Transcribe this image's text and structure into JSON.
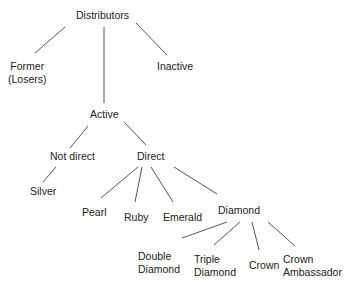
{
  "diagram": {
    "type": "tree",
    "line_color": "#555555",
    "nodes": {
      "distributors": {
        "label": "Distributors"
      },
      "former": {
        "line1": "Former",
        "line2": "(Losers)"
      },
      "inactive": {
        "label": "Inactive"
      },
      "active": {
        "label": "Active"
      },
      "not_direct": {
        "label": "Not direct"
      },
      "direct": {
        "label": "Direct"
      },
      "silver": {
        "label": "Silver"
      },
      "pearl": {
        "label": "Pearl"
      },
      "ruby": {
        "label": "Ruby"
      },
      "emerald": {
        "label": "Emerald"
      },
      "diamond": {
        "label": "Diamond"
      },
      "double_diamond": {
        "line1": "Double",
        "line2": "Diamond"
      },
      "triple_diamond": {
        "line1": "Triple",
        "line2": "Diamond"
      },
      "crown": {
        "label": "Crown"
      },
      "crown_ambassador": {
        "line1": "Crown",
        "line2": "Ambassador"
      }
    },
    "edges": [
      [
        "distributors",
        "former"
      ],
      [
        "distributors",
        "active"
      ],
      [
        "distributors",
        "inactive"
      ],
      [
        "active",
        "not_direct"
      ],
      [
        "active",
        "direct"
      ],
      [
        "not_direct",
        "silver"
      ],
      [
        "direct",
        "pearl"
      ],
      [
        "direct",
        "ruby"
      ],
      [
        "direct",
        "emerald"
      ],
      [
        "direct",
        "diamond"
      ],
      [
        "diamond",
        "double_diamond"
      ],
      [
        "diamond",
        "triple_diamond"
      ],
      [
        "diamond",
        "crown"
      ],
      [
        "diamond",
        "crown_ambassador"
      ]
    ]
  }
}
